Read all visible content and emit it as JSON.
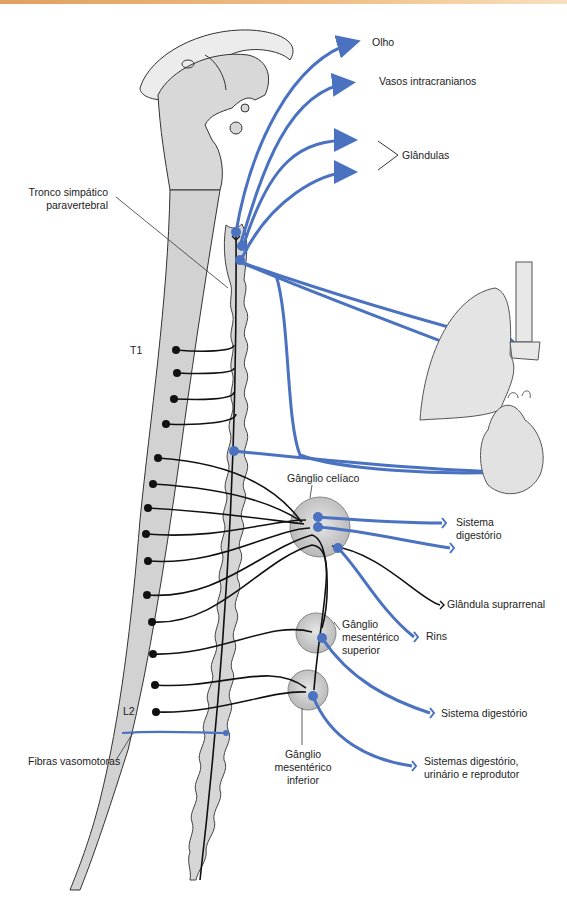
{
  "figure": {
    "accent_colors": {
      "sympathetic_post": "#4a72c0",
      "sympathetic_pre": "#111111",
      "tissue": "#d4d4d4",
      "top_bar": "#e8a868"
    }
  },
  "labels": {
    "olho": "Olho",
    "vasos": "Vasos intracranianos",
    "glandulas": "Glândulas",
    "tronco_line1": "Tronco simpático",
    "tronco_line2": "paravertebral",
    "t1": "T1",
    "l2": "L2",
    "celiaco": "Gânglio celíaco",
    "sist_dig_line1": "Sistema",
    "sist_dig_line2": "digestório",
    "suprarrenal": "Glândula suprarrenal",
    "rins": "Rins",
    "mes_sup_line1": "Gânglio",
    "mes_sup_line2": "mesentérico",
    "mes_sup_line3": "superior",
    "sist_dig2": "Sistema digestório",
    "sistemas_line1": "Sistemas digestório,",
    "sistemas_line2": "urinário e reprodutor",
    "fibras": "Fibras vasomotoras",
    "mes_inf_line1": "Gânglio",
    "mes_inf_line2": "mesentérico",
    "mes_inf_line3": "inferior"
  }
}
